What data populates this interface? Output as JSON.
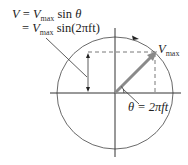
{
  "diagram": {
    "equation": {
      "line1": {
        "lhs": "V",
        "eq": "=",
        "var": "V",
        "sub": "max",
        "fn": "sin",
        "arg": "θ"
      },
      "line2": {
        "eq": "=",
        "var": "V",
        "sub": "max",
        "fn": "sin(2πft)"
      }
    },
    "phasor_label": {
      "var": "V",
      "sub": "max"
    },
    "angle_label": {
      "text": "θ = 2πft"
    },
    "colors": {
      "lines": "#333333",
      "phasor": "#8a8a8a",
      "dashed": "#555555",
      "text": "#222222"
    },
    "geometry": {
      "center": [
        115,
        93
      ],
      "radius_x": 58,
      "radius_y": 56,
      "phasor_tip": [
        156,
        52
      ],
      "rotation": "counterclockwise"
    }
  }
}
